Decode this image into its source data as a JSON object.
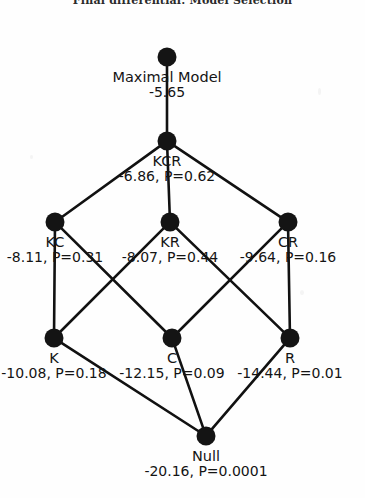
{
  "figure": {
    "clipped_header_text": "Final differential: Model Selection",
    "background_color": "#fefefe",
    "node_color": "#141414",
    "edge_color": "#111111"
  },
  "diagram": {
    "type": "model-selection-lattice",
    "levels": [
      {
        "level": 0,
        "nodes": [
          {
            "id": "maximal",
            "name": "Maximal Model",
            "stat": "-5.65",
            "aic": -5.65,
            "p_value": null,
            "x": 167,
            "y": 57
          }
        ]
      },
      {
        "level": 1,
        "nodes": [
          {
            "id": "KCR",
            "name": "KCR",
            "stat": "-6.86, P=0.62",
            "aic": -6.86,
            "p_value": 0.62,
            "x": 167,
            "y": 141
          }
        ]
      },
      {
        "level": 2,
        "nodes": [
          {
            "id": "KC",
            "name": "KC",
            "stat": "-8.11, P=0.31",
            "aic": -8.11,
            "p_value": 0.31,
            "x": 55,
            "y": 222
          },
          {
            "id": "KR",
            "name": "KR",
            "stat": "-8.07, P=0.44",
            "aic": -8.07,
            "p_value": 0.44,
            "x": 170,
            "y": 222
          },
          {
            "id": "CR",
            "name": "CR",
            "stat": "-9.64, P=0.16",
            "aic": -9.64,
            "p_value": 0.16,
            "x": 288,
            "y": 222
          }
        ]
      },
      {
        "level": 3,
        "nodes": [
          {
            "id": "K",
            "name": "K",
            "stat": "-10.08, P=0.18",
            "aic": -10.08,
            "p_value": 0.18,
            "x": 54,
            "y": 338
          },
          {
            "id": "C",
            "name": "C",
            "stat": "-12.15, P=0.09",
            "aic": -12.15,
            "p_value": 0.09,
            "x": 172,
            "y": 338
          },
          {
            "id": "R",
            "name": "R",
            "stat": "-14.44, P=0.01",
            "aic": -14.44,
            "p_value": 0.01,
            "x": 290,
            "y": 338
          }
        ]
      },
      {
        "level": 4,
        "nodes": [
          {
            "id": "Null",
            "name": "Null",
            "stat": "-20.16, P=0.0001",
            "aic": -20.16,
            "p_value": 0.0001,
            "x": 206,
            "y": 436
          }
        ]
      }
    ],
    "edges": [
      {
        "from": "maximal",
        "to": "KCR"
      },
      {
        "from": "KCR",
        "to": "KC"
      },
      {
        "from": "KCR",
        "to": "KR"
      },
      {
        "from": "KCR",
        "to": "CR"
      },
      {
        "from": "KC",
        "to": "K"
      },
      {
        "from": "KC",
        "to": "C"
      },
      {
        "from": "KR",
        "to": "K"
      },
      {
        "from": "KR",
        "to": "R"
      },
      {
        "from": "CR",
        "to": "C"
      },
      {
        "from": "CR",
        "to": "R"
      },
      {
        "from": "K",
        "to": "Null"
      },
      {
        "from": "C",
        "to": "Null"
      },
      {
        "from": "R",
        "to": "Null"
      }
    ]
  }
}
